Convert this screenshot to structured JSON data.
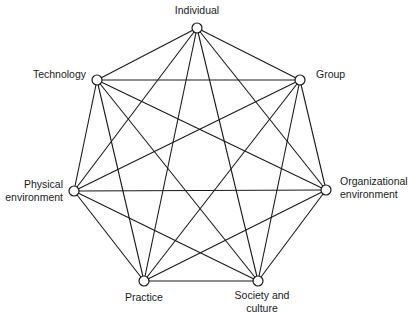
{
  "diagram": {
    "type": "complete-graph",
    "nodes": [
      {
        "id": "individual",
        "label_lines": [
          "Individual"
        ],
        "x": 197,
        "y": 28
      },
      {
        "id": "group",
        "label_lines": [
          "Group"
        ],
        "x": 300,
        "y": 80
      },
      {
        "id": "organizational_environment",
        "label_lines": [
          "Organizational",
          "environment"
        ],
        "x": 326,
        "y": 190
      },
      {
        "id": "society_and_culture",
        "label_lines": [
          "Society and",
          "culture"
        ],
        "x": 258,
        "y": 281
      },
      {
        "id": "practice",
        "label_lines": [
          "Practice"
        ],
        "x": 144,
        "y": 281
      },
      {
        "id": "physical_environment",
        "label_lines": [
          "Physical",
          "environment"
        ],
        "x": 74,
        "y": 191
      },
      {
        "id": "technology",
        "label_lines": [
          "Technology"
        ],
        "x": 97,
        "y": 80
      }
    ],
    "edges": "all pairs connected (21 edges)",
    "node_radius": 5,
    "colors": {
      "line": "#1a1a1a",
      "node_fill": "#ffffff",
      "background": "#ffffff"
    }
  },
  "labels": {
    "individual": [
      "Individual"
    ],
    "group": [
      "Group"
    ],
    "organizational_environment": [
      "Organizational",
      "environment"
    ],
    "society_and_culture": [
      "Society and",
      "culture"
    ],
    "practice": [
      "Practice"
    ],
    "physical_environment": [
      "Physical",
      "environment"
    ],
    "technology": [
      "Technology"
    ]
  }
}
